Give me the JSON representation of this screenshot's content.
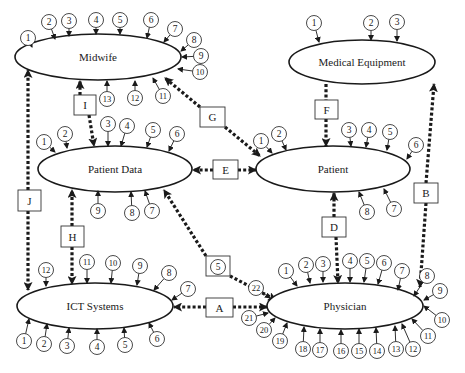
{
  "diagram": {
    "type": "entity-relationship",
    "entities": [
      {
        "id": "midwife",
        "label": "Midwife",
        "cx": 98,
        "cy": 57,
        "rx": 83,
        "ry": 23,
        "pins": [
          {
            "n": "1",
            "x": 28,
            "y": 38,
            "tx": 32,
            "ty": 47
          },
          {
            "n": "2",
            "x": 49,
            "y": 22,
            "tx": 55,
            "ty": 39
          },
          {
            "n": "3",
            "x": 69,
            "y": 21,
            "tx": 69,
            "ty": 36
          },
          {
            "n": "4",
            "x": 96,
            "y": 20,
            "tx": 96,
            "ty": 34
          },
          {
            "n": "5",
            "x": 120,
            "y": 20,
            "tx": 120,
            "ty": 34
          },
          {
            "n": "6",
            "x": 151,
            "y": 20,
            "tx": 147,
            "ty": 38
          },
          {
            "n": "7",
            "x": 175,
            "y": 29,
            "tx": 164,
            "ty": 42
          },
          {
            "n": "8",
            "x": 194,
            "y": 40,
            "tx": 181,
            "ty": 51
          },
          {
            "n": "9",
            "x": 201,
            "y": 56,
            "tx": 182,
            "ty": 57
          },
          {
            "n": "10",
            "x": 200,
            "y": 72,
            "tx": 178,
            "ty": 69
          },
          {
            "n": "11",
            "x": 163,
            "y": 96,
            "tx": 153,
            "ty": 78
          },
          {
            "n": "12",
            "x": 135,
            "y": 98,
            "tx": 135,
            "ty": 81
          },
          {
            "n": "13",
            "x": 107,
            "y": 99,
            "tx": 107,
            "ty": 81
          }
        ]
      },
      {
        "id": "medical-equipment",
        "label": "Medical Equipment",
        "cx": 362,
        "cy": 62,
        "rx": 73,
        "ry": 22,
        "pins": [
          {
            "n": "1",
            "x": 314,
            "y": 23,
            "tx": 319,
            "ty": 42
          },
          {
            "n": "2",
            "x": 371,
            "y": 23,
            "tx": 371,
            "ty": 40
          },
          {
            "n": "3",
            "x": 397,
            "y": 22,
            "tx": 397,
            "ty": 41
          }
        ]
      },
      {
        "id": "patient-data",
        "label": "Patient Data",
        "cx": 115,
        "cy": 169,
        "rx": 77,
        "ry": 23,
        "pins": [
          {
            "n": "1",
            "x": 44,
            "y": 142,
            "tx": 55,
            "ty": 152
          },
          {
            "n": "2",
            "x": 65,
            "y": 134,
            "tx": 67,
            "ty": 148
          },
          {
            "n": "3",
            "x": 108,
            "y": 124,
            "tx": 108,
            "ty": 146
          },
          {
            "n": "4",
            "x": 127,
            "y": 126,
            "tx": 121,
            "ty": 146
          },
          {
            "n": "5",
            "x": 153,
            "y": 130,
            "tx": 147,
            "ty": 147
          },
          {
            "n": "6",
            "x": 177,
            "y": 134,
            "tx": 169,
            "ty": 151
          },
          {
            "n": "7",
            "x": 152,
            "y": 211,
            "tx": 145,
            "ty": 191
          },
          {
            "n": "8",
            "x": 132,
            "y": 213,
            "tx": 131,
            "ty": 192
          },
          {
            "n": "9",
            "x": 98,
            "y": 211,
            "tx": 98,
            "ty": 191
          }
        ]
      },
      {
        "id": "patient",
        "label": "Patient",
        "cx": 333,
        "cy": 169,
        "rx": 77,
        "ry": 23,
        "pins": [
          {
            "n": "1",
            "x": 261,
            "y": 141,
            "tx": 272,
            "ty": 153
          },
          {
            "n": "2",
            "x": 279,
            "y": 134,
            "tx": 286,
            "ty": 150
          },
          {
            "n": "3",
            "x": 349,
            "y": 130,
            "tx": 351,
            "ty": 146
          },
          {
            "n": "4",
            "x": 369,
            "y": 130,
            "tx": 366,
            "ty": 147
          },
          {
            "n": "5",
            "x": 390,
            "y": 132,
            "tx": 387,
            "ty": 150
          },
          {
            "n": "6",
            "x": 416,
            "y": 145,
            "tx": 407,
            "ty": 159
          },
          {
            "n": "7",
            "x": 394,
            "y": 209,
            "tx": 384,
            "ty": 189
          },
          {
            "n": "8",
            "x": 367,
            "y": 212,
            "tx": 359,
            "ty": 192
          }
        ]
      },
      {
        "id": "ict-systems",
        "label": "ICT Systems",
        "cx": 95,
        "cy": 306,
        "rx": 78,
        "ry": 23,
        "pins": [
          {
            "n": "12",
            "x": 46,
            "y": 270,
            "tx": 46,
            "ty": 286
          },
          {
            "n": "11",
            "x": 87,
            "y": 262,
            "tx": 87,
            "ty": 283
          },
          {
            "n": "10",
            "x": 113,
            "y": 263,
            "tx": 111,
            "ty": 283
          },
          {
            "n": "9",
            "x": 140,
            "y": 266,
            "tx": 137,
            "ty": 285
          },
          {
            "n": "8",
            "x": 169,
            "y": 273,
            "tx": 154,
            "ty": 290
          },
          {
            "n": "7",
            "x": 188,
            "y": 289,
            "tx": 172,
            "ty": 300
          },
          {
            "n": "1",
            "x": 24,
            "y": 341,
            "tx": 29,
            "ty": 319
          },
          {
            "n": "2",
            "x": 44,
            "y": 344,
            "tx": 47,
            "ty": 324
          },
          {
            "n": "3",
            "x": 67,
            "y": 346,
            "tx": 69,
            "ty": 328
          },
          {
            "n": "4",
            "x": 97,
            "y": 347,
            "tx": 97,
            "ty": 329
          },
          {
            "n": "5",
            "x": 125,
            "y": 345,
            "tx": 124,
            "ty": 328
          },
          {
            "n": "6",
            "x": 157,
            "y": 339,
            "tx": 149,
            "ty": 323
          }
        ]
      },
      {
        "id": "physician",
        "label": "Physician",
        "cx": 345,
        "cy": 306,
        "rx": 78,
        "ry": 23,
        "pins": [
          {
            "n": "1",
            "x": 286,
            "y": 271,
            "tx": 297,
            "ty": 286
          },
          {
            "n": "2",
            "x": 306,
            "y": 265,
            "tx": 310,
            "ty": 283
          },
          {
            "n": "3",
            "x": 323,
            "y": 264,
            "tx": 323,
            "ty": 282
          },
          {
            "n": "4",
            "x": 350,
            "y": 261,
            "tx": 350,
            "ty": 282
          },
          {
            "n": "5",
            "x": 367,
            "y": 261,
            "tx": 364,
            "ty": 282
          },
          {
            "n": "6",
            "x": 384,
            "y": 263,
            "tx": 378,
            "ty": 284
          },
          {
            "n": "7",
            "x": 402,
            "y": 271,
            "tx": 398,
            "ty": 290
          },
          {
            "n": "8",
            "x": 427,
            "y": 276,
            "tx": 414,
            "ty": 296
          },
          {
            "n": "9",
            "x": 440,
            "y": 291,
            "tx": 424,
            "ty": 300
          },
          {
            "n": "10",
            "x": 442,
            "y": 320,
            "tx": 424,
            "ty": 306
          },
          {
            "n": "11",
            "x": 428,
            "y": 336,
            "tx": 412,
            "ty": 319
          },
          {
            "n": "12",
            "x": 413,
            "y": 349,
            "tx": 402,
            "ty": 324
          },
          {
            "n": "13",
            "x": 396,
            "y": 349,
            "tx": 395,
            "ty": 326
          },
          {
            "n": "14",
            "x": 377,
            "y": 351,
            "tx": 376,
            "ty": 328
          },
          {
            "n": "15",
            "x": 359,
            "y": 351,
            "tx": 359,
            "ty": 329
          },
          {
            "n": "16",
            "x": 341,
            "y": 351,
            "tx": 341,
            "ty": 330
          },
          {
            "n": "17",
            "x": 320,
            "y": 350,
            "tx": 320,
            "ty": 329
          },
          {
            "n": "18",
            "x": 303,
            "y": 349,
            "tx": 304,
            "ty": 327
          },
          {
            "n": "19",
            "x": 280,
            "y": 341,
            "tx": 287,
            "ty": 323
          },
          {
            "n": "20",
            "x": 264,
            "y": 330,
            "tx": 275,
            "ty": 318
          },
          {
            "n": "21",
            "x": 249,
            "y": 318,
            "tx": 268,
            "ty": 313
          },
          {
            "n": "22",
            "x": 256,
            "y": 288,
            "tx": 270,
            "ty": 298
          }
        ]
      }
    ],
    "relationships": [
      {
        "label": "A",
        "box": {
          "x": 206,
          "y": 298,
          "w": 27,
          "h": 19
        },
        "path": [
          [
            233,
            307
          ],
          [
            267,
            307
          ]
        ],
        "path2": [
          [
            206,
            307
          ],
          [
            174,
            307
          ]
        ],
        "arrow_start": false,
        "arrow_end": true,
        "arrow2_end": true
      },
      {
        "label": "B",
        "box": {
          "x": 414,
          "y": 183,
          "w": 24,
          "h": 20
        },
        "path": [
          [
            426,
            183
          ],
          [
            434,
            84
          ]
        ],
        "path2": [
          [
            426,
            203
          ],
          [
            420,
            287
          ]
        ],
        "arrow_start": false,
        "arrow_end": true,
        "arrow2_end": true
      },
      {
        "label": "C",
        "box": {
          "x": 206,
          "y": 256,
          "w": 24,
          "h": 20
        },
        "path": [
          [
            206,
            256
          ],
          [
            164,
            190
          ]
        ],
        "path2": [
          [
            230,
            276
          ],
          [
            276,
            300
          ]
        ],
        "arrow_start": false,
        "arrow_end": true,
        "arrow2_end": true
      },
      {
        "label": "D",
        "box": {
          "x": 322,
          "y": 217,
          "w": 24,
          "h": 20
        },
        "path": [
          [
            334,
            217
          ],
          [
            334,
            193
          ]
        ],
        "path2": [
          [
            336,
            237
          ],
          [
            338,
            283
          ]
        ],
        "arrow_start": false,
        "arrow_end": true,
        "arrow2_end": true
      },
      {
        "label": "E",
        "box": {
          "x": 213,
          "y": 160,
          "w": 25,
          "h": 19
        },
        "path": [
          [
            213,
            170
          ],
          [
            193,
            170
          ]
        ],
        "path2": [
          [
            238,
            170
          ],
          [
            256,
            170
          ]
        ],
        "arrow_start": false,
        "arrow_end": true,
        "arrow2_end": true
      },
      {
        "label": "F",
        "box": {
          "x": 315,
          "y": 100,
          "w": 23,
          "h": 19
        },
        "path": [
          [
            326,
            84
          ],
          [
            326,
            100
          ]
        ],
        "path2": [
          [
            326,
            119
          ],
          [
            326,
            146
          ]
        ],
        "arrow_start": false,
        "arrow_end": false,
        "arrow2_end": true
      },
      {
        "label": "G",
        "box": {
          "x": 200,
          "y": 107,
          "w": 25,
          "h": 20
        },
        "path": [
          [
            200,
            107
          ],
          [
            165,
            78
          ]
        ],
        "path2": [
          [
            225,
            127
          ],
          [
            260,
            156
          ]
        ],
        "arrow_start": false,
        "arrow_end": true,
        "arrow2_end": true
      },
      {
        "label": "H",
        "box": {
          "x": 61,
          "y": 226,
          "w": 23,
          "h": 21
        },
        "path": [
          [
            72,
            226
          ],
          [
            72,
            190
          ]
        ],
        "path2": [
          [
            72,
            247
          ],
          [
            72,
            284
          ]
        ],
        "arrow_start": false,
        "arrow_end": true,
        "arrow2_end": true
      },
      {
        "label": "I",
        "box": {
          "x": 74,
          "y": 95,
          "w": 22,
          "h": 20
        },
        "path": [
          [
            80,
            95
          ],
          [
            80,
            81
          ]
        ],
        "path2": [
          [
            89,
            115
          ],
          [
            94,
            146
          ]
        ],
        "arrow_start": false,
        "arrow_end": true,
        "arrow2_end": true
      },
      {
        "label": "J",
        "box": {
          "x": 18,
          "y": 190,
          "w": 23,
          "h": 21
        },
        "path": [
          [
            28,
            190
          ],
          [
            28,
            70
          ]
        ],
        "path2": [
          [
            28,
            211
          ],
          [
            28,
            290
          ]
        ],
        "arrow_start": false,
        "arrow_end": true,
        "arrow2_end": true
      }
    ],
    "floating_pins": [
      {
        "n": "5",
        "x": 218,
        "y": 267
      }
    ]
  }
}
